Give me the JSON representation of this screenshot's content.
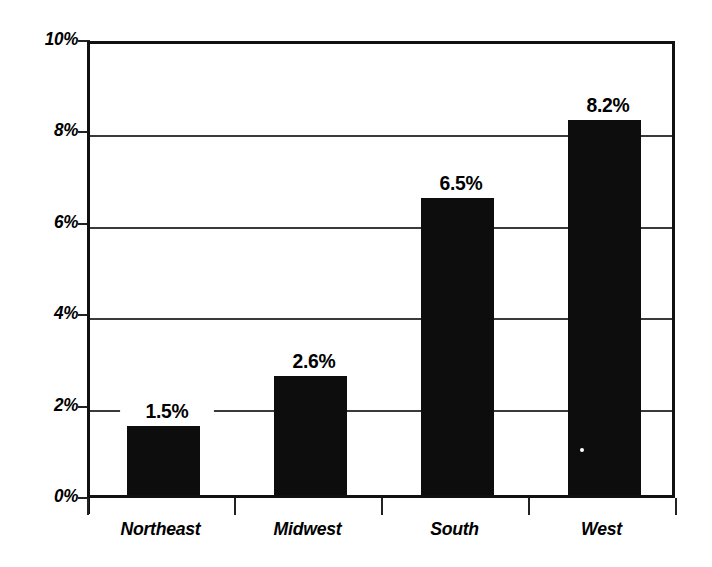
{
  "chart_data": {
    "type": "bar",
    "title": "",
    "subtitle": "",
    "xlabel": "",
    "ylabel": "",
    "categories": [
      "Northeast",
      "Midwest",
      "South",
      "West"
    ],
    "values": [
      1.5,
      2.6,
      6.5,
      8.2
    ],
    "value_labels": [
      "1.5%",
      "2.6%",
      "6.5%",
      "8.2%"
    ],
    "ylim": [
      0,
      10
    ],
    "ytick_values": [
      0,
      2,
      4,
      6,
      8,
      10
    ],
    "ytick_labels": [
      "0%",
      "2%",
      "4%",
      "6%",
      "8%",
      "10%"
    ],
    "unit": "%",
    "grid": "horizontal",
    "legend": "none",
    "bar_color": "#0d0d0d",
    "grid_color": "#3a3a3a",
    "frame_color": "#111111",
    "background_color": "#ffffff",
    "series": [
      {
        "name": "",
        "values": [
          1.5,
          2.6,
          6.5,
          8.2
        ]
      }
    ]
  }
}
